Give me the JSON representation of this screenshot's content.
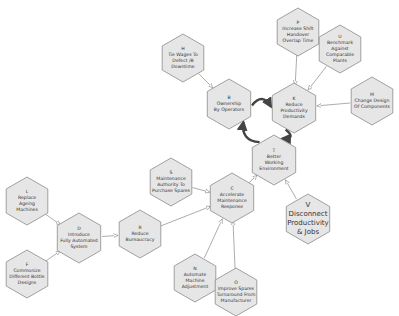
{
  "diagram": {
    "type": "strategy hexagon map",
    "colors": {
      "hex_fill": "#e6e6e6",
      "hex_stroke": "#8a8a8a",
      "thin_edge": "#8a8a8a",
      "strong_edge": "#444444",
      "text": "#333333"
    },
    "nodes": [
      {
        "id": "H",
        "letter": "H",
        "lines": [
          "Tie Wages To",
          "Defect /B",
          "Downtime"
        ],
        "x": 183,
        "y": 58,
        "r": 24
      },
      {
        "id": "B",
        "letter": "B",
        "lines": [
          "Ownership",
          "By Operators"
        ],
        "x": 229,
        "y": 104,
        "r": 25
      },
      {
        "id": "P",
        "letter": "P",
        "lines": [
          "Increase Shift",
          "Handover",
          "Overlap Time"
        ],
        "x": 298,
        "y": 32,
        "r": 24
      },
      {
        "id": "U",
        "letter": "U",
        "lines": [
          "Benchmark",
          "Against",
          "Comparable",
          "Plants"
        ],
        "x": 340,
        "y": 49,
        "r": 24
      },
      {
        "id": "K",
        "letter": "K",
        "lines": [
          "Reduce",
          "Productivity",
          "Demands"
        ],
        "x": 294,
        "y": 108,
        "r": 25
      },
      {
        "id": "M",
        "letter": "M",
        "lines": [
          "Change Design",
          "Of Components"
        ],
        "x": 372,
        "y": 101,
        "r": 24
      },
      {
        "id": "T",
        "letter": "T",
        "lines": [
          "Better",
          "Working",
          "Environment"
        ],
        "x": 274,
        "y": 160,
        "r": 25
      },
      {
        "id": "S",
        "letter": "S",
        "lines": [
          "Maintenance",
          "Authority To",
          "Purchase Spares"
        ],
        "x": 171,
        "y": 182,
        "r": 24
      },
      {
        "id": "C",
        "letter": "C",
        "lines": [
          "Accelerate",
          "Maintenance",
          "Response"
        ],
        "x": 232,
        "y": 198,
        "r": 25
      },
      {
        "id": "V",
        "letter": "V",
        "lines": [
          "Disconnect",
          "Productivity",
          "& Jobs"
        ],
        "x": 308,
        "y": 219,
        "r": 25,
        "big": true
      },
      {
        "id": "L",
        "letter": "L",
        "lines": [
          "Replace",
          "Ageing",
          "Machines"
        ],
        "x": 27,
        "y": 201,
        "r": 24
      },
      {
        "id": "D",
        "letter": "D",
        "lines": [
          "Introduce",
          "Fully Automated",
          "System"
        ],
        "x": 79,
        "y": 238,
        "r": 25
      },
      {
        "id": "R",
        "letter": "R",
        "lines": [
          "Reduce",
          "Bureaucracy"
        ],
        "x": 140,
        "y": 234,
        "r": 24
      },
      {
        "id": "F",
        "letter": "F",
        "lines": [
          "Commonize",
          "Different Bottle",
          "Designs"
        ],
        "x": 27,
        "y": 274,
        "r": 24
      },
      {
        "id": "N",
        "letter": "N",
        "lines": [
          "Automate",
          "Machine",
          "Adjustment"
        ],
        "x": 195,
        "y": 278,
        "r": 24
      },
      {
        "id": "O",
        "letter": "O",
        "lines": [
          "Improve Spares",
          "Turnaround From",
          "Manufacturer"
        ],
        "x": 236,
        "y": 292,
        "r": 24
      }
    ],
    "edges": [
      {
        "from": "H",
        "to": "B",
        "style": "thin"
      },
      {
        "from": "P",
        "to": "K",
        "style": "thin"
      },
      {
        "from": "U",
        "to": "K",
        "style": "thin"
      },
      {
        "from": "M",
        "to": "K",
        "style": "thin"
      },
      {
        "from": "B",
        "to": "K",
        "style": "strong"
      },
      {
        "from": "K",
        "to": "T",
        "style": "strong"
      },
      {
        "from": "T",
        "to": "B",
        "style": "strong"
      },
      {
        "from": "C",
        "to": "T",
        "style": "thin"
      },
      {
        "from": "V",
        "to": "T",
        "style": "thin"
      },
      {
        "from": "S",
        "to": "C",
        "style": "thin"
      },
      {
        "from": "R",
        "to": "C",
        "style": "thin"
      },
      {
        "from": "N",
        "to": "C",
        "style": "thin"
      },
      {
        "from": "O",
        "to": "C",
        "style": "thin"
      },
      {
        "from": "D",
        "to": "R",
        "style": "thin"
      },
      {
        "from": "L",
        "to": "D",
        "style": "thin"
      },
      {
        "from": "F",
        "to": "D",
        "style": "thin"
      }
    ]
  }
}
